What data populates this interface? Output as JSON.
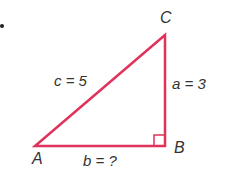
{
  "diagram": {
    "type": "right-triangle",
    "line_color": "#e0325a",
    "label_color": "#333333",
    "vertices": [
      {
        "name": "A",
        "label": "A",
        "x": 35,
        "y": 146
      },
      {
        "name": "B",
        "label": "B",
        "x": 165,
        "y": 146
      },
      {
        "name": "C",
        "label": "C",
        "x": 165,
        "y": 35
      }
    ],
    "right_angle_at": "B",
    "sides": {
      "c": {
        "label": "c = 5",
        "between": [
          "A",
          "C"
        ]
      },
      "a": {
        "label": "a = 3",
        "between": [
          "B",
          "C"
        ]
      },
      "b": {
        "label": "b = ?",
        "between": [
          "A",
          "B"
        ]
      }
    },
    "labels": {
      "A": "A",
      "B": "B",
      "C": "C",
      "c": "c = 5",
      "a": "a = 3",
      "b": "b = ?"
    }
  }
}
